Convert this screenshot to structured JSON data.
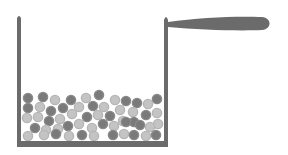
{
  "diagram": {
    "colors": {
      "background": "#ffffff",
      "pot": "#6b6b6b",
      "particle_dark": "#7a7a7a",
      "particle_mid": "#9a9a9a",
      "particle_light": "#c4c4c4"
    },
    "particles": [
      {
        "x": 28,
        "y": 98,
        "t": "d"
      },
      {
        "x": 43,
        "y": 97,
        "t": "d"
      },
      {
        "x": 55,
        "y": 100,
        "t": "l"
      },
      {
        "x": 71,
        "y": 100,
        "t": "d"
      },
      {
        "x": 86,
        "y": 98,
        "t": "l"
      },
      {
        "x": 99,
        "y": 95,
        "t": "d"
      },
      {
        "x": 115,
        "y": 100,
        "t": "l"
      },
      {
        "x": 126,
        "y": 101,
        "t": "d"
      },
      {
        "x": 137,
        "y": 103,
        "t": "d"
      },
      {
        "x": 148,
        "y": 104,
        "t": "l"
      },
      {
        "x": 157,
        "y": 99,
        "t": "d"
      },
      {
        "x": 28,
        "y": 108,
        "t": "d"
      },
      {
        "x": 40,
        "y": 107,
        "t": "l"
      },
      {
        "x": 51,
        "y": 111,
        "t": "d"
      },
      {
        "x": 63,
        "y": 108,
        "t": "d"
      },
      {
        "x": 79,
        "y": 107,
        "t": "l"
      },
      {
        "x": 93,
        "y": 106,
        "t": "d"
      },
      {
        "x": 104,
        "y": 107,
        "t": "l"
      },
      {
        "x": 120,
        "y": 110,
        "t": "l"
      },
      {
        "x": 133,
        "y": 112,
        "t": "l"
      },
      {
        "x": 146,
        "y": 115,
        "t": "d"
      },
      {
        "x": 157,
        "y": 113,
        "t": "l"
      },
      {
        "x": 27,
        "y": 118,
        "t": "l"
      },
      {
        "x": 38,
        "y": 117,
        "t": "l"
      },
      {
        "x": 49,
        "y": 121,
        "t": "d"
      },
      {
        "x": 60,
        "y": 119,
        "t": "l"
      },
      {
        "x": 72,
        "y": 114,
        "t": "l"
      },
      {
        "x": 87,
        "y": 117,
        "t": "d"
      },
      {
        "x": 98,
        "y": 115,
        "t": "l"
      },
      {
        "x": 110,
        "y": 116,
        "t": "d"
      },
      {
        "x": 123,
        "y": 121,
        "t": "l"
      },
      {
        "x": 134,
        "y": 122,
        "t": "d"
      },
      {
        "x": 158,
        "y": 124,
        "t": "l"
      },
      {
        "x": 35,
        "y": 128,
        "t": "d"
      },
      {
        "x": 46,
        "y": 130,
        "t": "l"
      },
      {
        "x": 58,
        "y": 129,
        "t": "l"
      },
      {
        "x": 68,
        "y": 126,
        "t": "d"
      },
      {
        "x": 79,
        "y": 124,
        "t": "l"
      },
      {
        "x": 92,
        "y": 128,
        "t": "l"
      },
      {
        "x": 103,
        "y": 124,
        "t": "d"
      },
      {
        "x": 114,
        "y": 126,
        "t": "l"
      },
      {
        "x": 126,
        "y": 122,
        "t": "d"
      },
      {
        "x": 140,
        "y": 125,
        "t": "d"
      },
      {
        "x": 150,
        "y": 127,
        "t": "l"
      },
      {
        "x": 28,
        "y": 136,
        "t": "l"
      },
      {
        "x": 44,
        "y": 135,
        "t": "l"
      },
      {
        "x": 56,
        "y": 134,
        "t": "d"
      },
      {
        "x": 69,
        "y": 136,
        "t": "l"
      },
      {
        "x": 82,
        "y": 135,
        "t": "d"
      },
      {
        "x": 94,
        "y": 136,
        "t": "l"
      },
      {
        "x": 113,
        "y": 135,
        "t": "d"
      },
      {
        "x": 124,
        "y": 134,
        "t": "l"
      },
      {
        "x": 134,
        "y": 135,
        "t": "d"
      },
      {
        "x": 146,
        "y": 136,
        "t": "l"
      },
      {
        "x": 156,
        "y": 135,
        "t": "d"
      }
    ]
  }
}
